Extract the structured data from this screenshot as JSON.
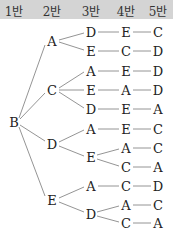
{
  "header": {
    "columns": [
      "1반",
      "2반",
      "3반",
      "4반",
      "5반"
    ],
    "background": "#d4d4d4"
  },
  "tree": {
    "root": "B",
    "branches": [
      {
        "label": "A",
        "children": [
          {
            "path": [
              "D",
              "E",
              "C"
            ]
          },
          {
            "path": [
              "E",
              "C",
              "D"
            ]
          }
        ]
      },
      {
        "label": "C",
        "children": [
          {
            "path": [
              "A",
              "E",
              "D"
            ]
          },
          {
            "path": [
              "E",
              "A",
              "D"
            ]
          },
          {
            "path": [
              "D",
              "E",
              "A"
            ]
          }
        ]
      },
      {
        "label": "D",
        "children": [
          {
            "path": [
              "A",
              "E",
              "C"
            ]
          },
          {
            "label": "E",
            "subpaths": [
              [
                "A",
                "C"
              ],
              [
                "C",
                "A"
              ]
            ]
          }
        ]
      },
      {
        "label": "E",
        "children": [
          {
            "path": [
              "A",
              "C",
              "D"
            ]
          },
          {
            "label": "D",
            "subpaths": [
              [
                "A",
                "C"
              ],
              [
                "C",
                "A"
              ]
            ]
          }
        ]
      }
    ]
  },
  "nodes": [
    {
      "id": "n-root-B",
      "t": "B",
      "x": 14,
      "y": 122
    },
    {
      "id": "n-A",
      "t": "A",
      "x": 52,
      "y": 41
    },
    {
      "id": "n-A-1-3",
      "t": "D",
      "x": 91,
      "y": 32
    },
    {
      "id": "n-A-1-4",
      "t": "E",
      "x": 126,
      "y": 32
    },
    {
      "id": "n-A-1-5",
      "t": "C",
      "x": 158,
      "y": 32
    },
    {
      "id": "n-A-2-3",
      "t": "E",
      "x": 91,
      "y": 51
    },
    {
      "id": "n-A-2-4",
      "t": "C",
      "x": 126,
      "y": 51
    },
    {
      "id": "n-A-2-5",
      "t": "D",
      "x": 158,
      "y": 51
    },
    {
      "id": "n-C",
      "t": "C",
      "x": 52,
      "y": 90
    },
    {
      "id": "n-C-1-3",
      "t": "A",
      "x": 91,
      "y": 71
    },
    {
      "id": "n-C-1-4",
      "t": "E",
      "x": 126,
      "y": 71
    },
    {
      "id": "n-C-1-5",
      "t": "D",
      "x": 158,
      "y": 71
    },
    {
      "id": "n-C-2-3",
      "t": "E",
      "x": 91,
      "y": 90
    },
    {
      "id": "n-C-2-4",
      "t": "A",
      "x": 126,
      "y": 90
    },
    {
      "id": "n-C-2-5",
      "t": "D",
      "x": 158,
      "y": 90
    },
    {
      "id": "n-C-3-3",
      "t": "D",
      "x": 91,
      "y": 109
    },
    {
      "id": "n-C-3-4",
      "t": "E",
      "x": 126,
      "y": 109
    },
    {
      "id": "n-C-3-5",
      "t": "A",
      "x": 158,
      "y": 109
    },
    {
      "id": "n-D",
      "t": "D",
      "x": 52,
      "y": 144
    },
    {
      "id": "n-D-1-3",
      "t": "A",
      "x": 91,
      "y": 129
    },
    {
      "id": "n-D-1-4",
      "t": "E",
      "x": 126,
      "y": 129
    },
    {
      "id": "n-D-1-5",
      "t": "C",
      "x": 158,
      "y": 129
    },
    {
      "id": "n-D-2-3",
      "t": "E",
      "x": 91,
      "y": 157
    },
    {
      "id": "n-D-2a-4",
      "t": "A",
      "x": 126,
      "y": 148
    },
    {
      "id": "n-D-2a-5",
      "t": "C",
      "x": 158,
      "y": 148
    },
    {
      "id": "n-D-2b-4",
      "t": "C",
      "x": 126,
      "y": 167
    },
    {
      "id": "n-D-2b-5",
      "t": "A",
      "x": 158,
      "y": 167
    },
    {
      "id": "n-E",
      "t": "E",
      "x": 52,
      "y": 200
    },
    {
      "id": "n-E-1-3",
      "t": "A",
      "x": 91,
      "y": 186
    },
    {
      "id": "n-E-1-4",
      "t": "C",
      "x": 126,
      "y": 186
    },
    {
      "id": "n-E-1-5",
      "t": "D",
      "x": 158,
      "y": 186
    },
    {
      "id": "n-E-2-3",
      "t": "D",
      "x": 91,
      "y": 214
    },
    {
      "id": "n-E-2a-4",
      "t": "A",
      "x": 126,
      "y": 205
    },
    {
      "id": "n-E-2a-5",
      "t": "C",
      "x": 158,
      "y": 205
    },
    {
      "id": "n-E-2b-4",
      "t": "C",
      "x": 126,
      "y": 223
    },
    {
      "id": "n-E-2b-5",
      "t": "A",
      "x": 158,
      "y": 223
    }
  ]
}
